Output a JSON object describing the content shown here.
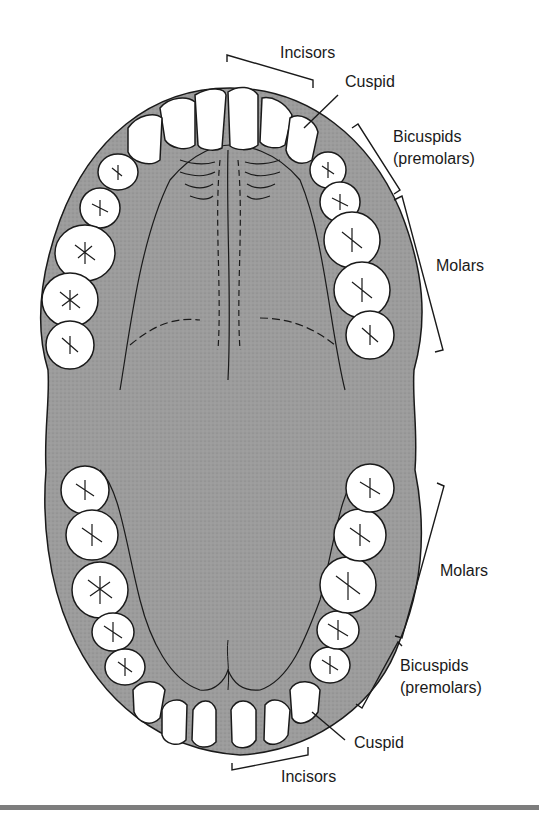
{
  "diagram": {
    "colors": {
      "gum": "#9a9a9a",
      "palate": "#a4a4a4",
      "tooth": "#ffffff",
      "outline": "#1a1a1a",
      "bar": "#7d7d7d"
    },
    "upper_jaw": {
      "labels": {
        "incisors": "Incisors",
        "cuspid": "Cuspid",
        "bicuspids_line1": "Bicuspids",
        "bicuspids_line2": "(premolars)",
        "molars": "Molars"
      }
    },
    "lower_jaw": {
      "labels": {
        "molars": "Molars",
        "bicuspids_line1": "Bicuspids",
        "bicuspids_line2": "(premolars)",
        "cuspid": "Cuspid",
        "incisors": "Incisors"
      }
    }
  }
}
